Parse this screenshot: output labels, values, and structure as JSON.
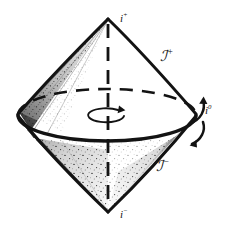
{
  "figure": {
    "kind": "conformal-penrose-diagram",
    "background_color": "#ffffff",
    "ink_color": "#131313",
    "stipple_color": "#2a2a2a"
  },
  "labels": {
    "future_timelike_infinity": {
      "base": "i",
      "sup": "+"
    },
    "past_timelike_infinity": {
      "base": "i",
      "sup": "−"
    },
    "spatial_infinity": {
      "base": "i",
      "sup": "0"
    },
    "future_null_infinity": {
      "base": "ℐ",
      "sup": "+"
    },
    "past_null_infinity": {
      "base": "ℐ",
      "sup": "−"
    }
  },
  "geometry": {
    "apex_top": {
      "x": 108,
      "y": 19
    },
    "apex_bottom": {
      "x": 108,
      "y": 212
    },
    "equator_center": {
      "x": 107,
      "y": 115
    },
    "equator_rx": 89,
    "equator_ry": 26,
    "axis": {
      "x": 108,
      "y_top": 24,
      "y_bottom": 208,
      "style": "dashed"
    },
    "rotation_marker": {
      "cx": 106,
      "cy": 116,
      "rx": 18,
      "ry": 7
    }
  },
  "annotations": {
    "axis_style": "dashed",
    "equator_back_style": "dashed",
    "equator_front_style": "solid",
    "shaded_wedges": 2,
    "rotation_arrows": 2
  }
}
